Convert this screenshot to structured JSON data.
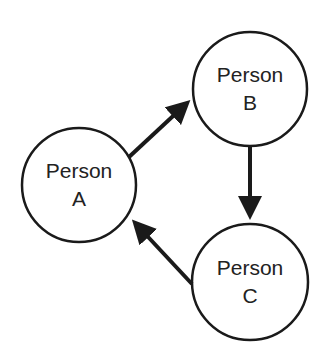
{
  "diagram": {
    "type": "directed-cycle",
    "nodes": [
      {
        "id": "A",
        "line1": "Person",
        "line2": "A"
      },
      {
        "id": "B",
        "line1": "Person",
        "line2": "B"
      },
      {
        "id": "C",
        "line1": "Person",
        "line2": "C"
      }
    ],
    "edges": [
      {
        "from": "A",
        "to": "B"
      },
      {
        "from": "B",
        "to": "C"
      },
      {
        "from": "C",
        "to": "A"
      }
    ],
    "colors": {
      "stroke": "#1a1a1a",
      "fill": "#ffffff",
      "text": "#222222"
    }
  }
}
